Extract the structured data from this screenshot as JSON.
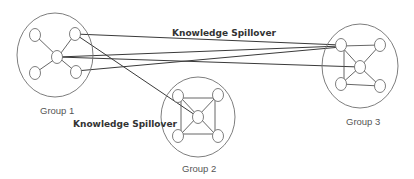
{
  "diagram": {
    "type": "network",
    "groups": [
      {
        "id": "g1",
        "label": "Group 1",
        "topology": "star"
      },
      {
        "id": "g2",
        "label": "Group 2",
        "topology": "square-with-diagonals"
      },
      {
        "id": "g3",
        "label": "Group 3",
        "topology": "square-with-diagonals"
      }
    ],
    "annotations": {
      "spillover_top": "Knowledge Spillover",
      "spillover_bottom": "Knowledge Spillover"
    },
    "inter_group_edges": [
      {
        "from": "g1.top-right",
        "to": "g3.top-left"
      },
      {
        "from": "g1.center",
        "to": "g3.top-left"
      },
      {
        "from": "g1.center",
        "to": "g3.center"
      },
      {
        "from": "g1.bottom-right",
        "to": "g3.top-left"
      },
      {
        "from": "g1.top-right",
        "to": "g2.center"
      }
    ],
    "colors": {
      "stroke": "#6f6f6f",
      "text": "#555555",
      "label_bold": "#333333"
    }
  }
}
